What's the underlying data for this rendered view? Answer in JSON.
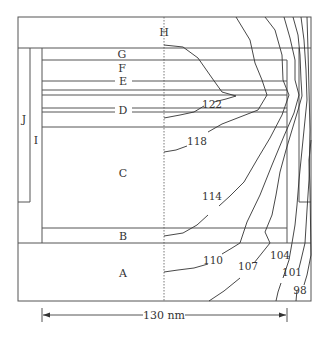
{
  "diagram": {
    "type": "cross-section with isotherm contours",
    "regions": {
      "H": "H",
      "G": "G",
      "F": "F",
      "E": "E",
      "D": "D",
      "C": "C",
      "B": "B",
      "A": "A",
      "I": "I",
      "J": "J"
    },
    "contours": {
      "c122": "122",
      "c118": "118",
      "c114": "114",
      "c110": "110",
      "c107": "107",
      "c104": "104",
      "c101": "101",
      "c98": "98"
    },
    "dimension": {
      "label": "130 nm"
    },
    "colors": {
      "line": "#555555",
      "contour": "#333333",
      "text": "#333333",
      "background": "#ffffff"
    }
  }
}
